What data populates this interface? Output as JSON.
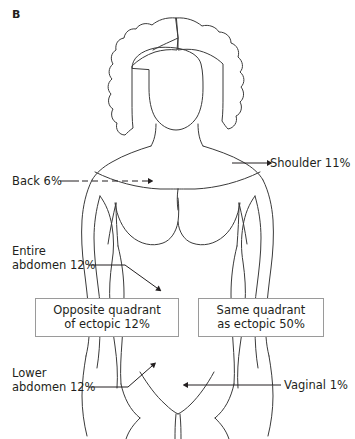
{
  "figure": {
    "panel_label": "B",
    "background_color": "#ffffff",
    "line_color": "#3a3a3a",
    "text_color": "#231f20",
    "box_border_color": "#9a9a9a"
  },
  "annotations": {
    "shoulder": {
      "text": "Shoulder 11%",
      "value": "11%",
      "site": "Shoulder",
      "leader": "solid-line-arrow-left"
    },
    "back": {
      "text": "Back 6%",
      "value": "6%",
      "site": "Back",
      "leader": "dashed-line-arrow-right"
    },
    "entire_abdomen": {
      "text": "Entire\nabdomen 12%",
      "value": "12%",
      "site": "Entire abdomen",
      "leader": "solid-line-arrow-down-right"
    },
    "lower_abdomen": {
      "text": "Lower\nabdomen 12%",
      "value": "12%",
      "site": "Lower abdomen",
      "leader": "solid-line-arrow-up-right"
    },
    "vaginal": {
      "text": "Vaginal 1%",
      "value": "1%",
      "site": "Vaginal",
      "leader": "solid-line-arrow-left"
    }
  },
  "callouts": {
    "left_box": {
      "text": "Opposite quadrant\nof ectopic 12%",
      "value": "12%",
      "site": "Opposite quadrant of ectopic"
    },
    "right_box": {
      "text": "Same quadrant\nas ectopic 50%",
      "value": "50%",
      "site": "Same quadrant as ectopic"
    }
  }
}
